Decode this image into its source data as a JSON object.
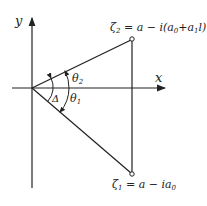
{
  "diagram": {
    "axes": {
      "x_label": "x",
      "y_label": "y"
    },
    "points": {
      "zeta2": {
        "label": "ζ₂ = a − i(a₀+a₁l)",
        "sym": "ζ",
        "sub": "2",
        "expr": " = a − i(a",
        "expr_sub": "0",
        "expr_tail": "+a",
        "expr_sub2": "1",
        "expr_end": "l)"
      },
      "zeta1": {
        "label": "ζ₁ = a − ia₀",
        "sym": "ζ",
        "sub": "1",
        "expr": " = a − ia",
        "expr_sub": "0"
      }
    },
    "angles": {
      "theta2": {
        "sym": "θ",
        "sub": "2"
      },
      "theta1": {
        "sym": "θ",
        "sub": "1"
      },
      "delta": {
        "sym": "Δ"
      }
    },
    "colors": {
      "line": "#222222",
      "background": "#ffffff"
    }
  }
}
